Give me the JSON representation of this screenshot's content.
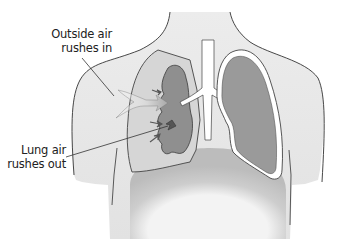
{
  "diagram": {
    "type": "anatomical-illustration",
    "labels": {
      "outside_air": {
        "line1": "Outside air",
        "line2": "rushes in"
      },
      "lung_air": {
        "line1": "Lung air",
        "line2": "rushes out"
      }
    },
    "colors": {
      "body_fill": "#ececec",
      "body_outline": "#333333",
      "lung_fill": "#9a9a9a",
      "collapsed_lung_fill": "#8f8f8f",
      "pleural_space": "#d4d4d4",
      "lung_outline": "#444444",
      "diaphragm": "#c8c8c8",
      "abdomen": "#f2f2f2",
      "background": "#ffffff"
    }
  }
}
